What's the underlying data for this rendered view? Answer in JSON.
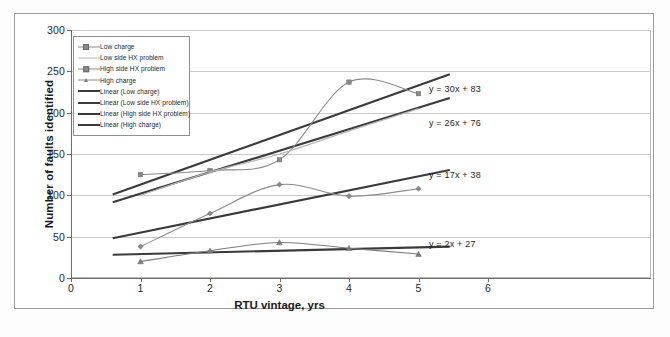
{
  "chart_data": {
    "type": "line",
    "title": "",
    "xlabel": "RTU vintage, yrs",
    "ylabel": "Number of faults identified",
    "xlim": [
      0,
      6
    ],
    "ylim": [
      0,
      300
    ],
    "xticks": [
      0,
      1,
      2,
      3,
      4,
      5,
      6
    ],
    "yticks": [
      0,
      50,
      100,
      150,
      200,
      250,
      300
    ],
    "grid": true,
    "legend_position": "upper-left",
    "x": [
      1,
      2,
      3,
      4,
      5
    ],
    "series": [
      {
        "name": "Low charge",
        "marker": "square",
        "color": "#8a8a8a",
        "values": [
          125,
          130,
          143,
          237,
          223
        ]
      },
      {
        "name": "Low side HX problem",
        "marker": "none",
        "color": "#b5b5b5",
        "values": [
          100,
          128,
          150,
          178,
          205
        ]
      },
      {
        "name": "High side HX problem",
        "marker": "diamond",
        "color": "#8a8a8a",
        "values": [
          38,
          78,
          113,
          99,
          108
        ]
      },
      {
        "name": "High charge",
        "marker": "triangle",
        "color": "#7d7d7d",
        "values": [
          20,
          33,
          43,
          36,
          29
        ]
      }
    ],
    "trendlines": [
      {
        "name": "Linear (Low charge)",
        "equation": "y = 30x + 83",
        "slope": 30,
        "intercept": 83,
        "color": "#3a3a3a"
      },
      {
        "name": "Linear (Low side HX problem)",
        "equation": "y = 26x + 76",
        "slope": 26,
        "intercept": 76,
        "color": "#3a3a3a"
      },
      {
        "name": "Linear (High side HX problem)",
        "equation": "y = 17x + 38",
        "slope": 17,
        "intercept": 38,
        "color": "#3a3a3a"
      },
      {
        "name": "Linear (High charge)",
        "equation": "y = 2x + 27",
        "slope": 2,
        "intercept": 27,
        "color": "#3a3a3a"
      }
    ],
    "legend_entries": [
      {
        "label": "Low charge",
        "key": "square-marker-line"
      },
      {
        "label": "Low side HX problem",
        "key": "plain-line"
      },
      {
        "label": "High side HX problem",
        "key": "diamond-marker-line"
      },
      {
        "label": "High charge",
        "key": "triangle-marker-line"
      },
      {
        "label": "Linear (Low charge)",
        "key": "thick-line"
      },
      {
        "label": "Linear (Low side HX problem)",
        "key": "thick-line"
      },
      {
        "label": "Linear (High side HX problem)",
        "key": "thick-line"
      },
      {
        "label": "Linear (High charge)",
        "key": "thick-line"
      }
    ],
    "annotations": [
      {
        "text": "y = 30x + 83",
        "x": 5.15,
        "y": 228
      },
      {
        "text": "y = 26x + 76",
        "x": 5.15,
        "y": 186
      },
      {
        "text": "y = 17x + 38",
        "x": 5.15,
        "y": 123
      },
      {
        "text": "y = 2x + 27",
        "x": 5.15,
        "y": 40
      }
    ]
  },
  "caption": ""
}
